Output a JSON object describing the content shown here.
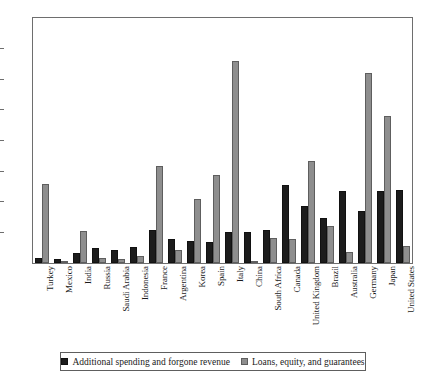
{
  "chart_data": {
    "type": "bar",
    "title": "",
    "subtitle": "",
    "xlabel": "",
    "ylabel": "",
    "ylim": [
      0,
      40
    ],
    "yticks": [
      0,
      5,
      10,
      15,
      20,
      25,
      30,
      35,
      40
    ],
    "ytick_labels": [
      "0",
      "5",
      "10",
      "15",
      "20",
      "25",
      "30",
      "35",
      "40"
    ],
    "grid": false,
    "legend_position": "bottom",
    "orientation": "vertical",
    "grouping": "grouped",
    "categories": [
      "Turkey",
      "Mexico",
      "India",
      "Russia",
      "Saudi Arabia",
      "Indonesia",
      "France",
      "Argentina",
      "Korea",
      "Spain",
      "Italy",
      "China",
      "South Africa",
      "Canada",
      "United Kingdom",
      "Brazil",
      "Australia",
      "Germany",
      "Japan",
      "United States"
    ],
    "series": [
      {
        "name": "Additional spending and forgone revenue",
        "color": "#1c1c1c",
        "values": [
          0.8,
          0.7,
          1.7,
          2.4,
          2.2,
          2.6,
          5.4,
          4.0,
          3.6,
          3.5,
          5.0,
          5.0,
          5.4,
          12.7,
          9.3,
          7.3,
          11.8,
          8.5,
          11.7,
          12.0
        ]
      },
      {
        "name": "Loans, equity, and guarantees",
        "color": "#8e8e8e",
        "values": [
          12.9,
          0.3,
          5.3,
          0.9,
          0.7,
          1.1,
          15.8,
          2.1,
          10.4,
          14.4,
          33.0,
          0.3,
          4.1,
          4.0,
          16.7,
          6.1,
          1.8,
          31.0,
          24.0,
          2.8
        ]
      }
    ]
  },
  "legend": {
    "entries": [
      {
        "label": "Additional spending and forgone revenue",
        "swatch": "dark"
      },
      {
        "label": "Loans, equity, and guarantees",
        "swatch": "light"
      }
    ]
  }
}
